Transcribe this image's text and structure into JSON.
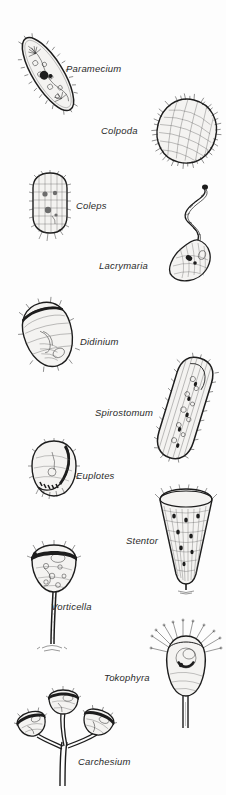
{
  "plate": {
    "title": "Ciliate protozoa illustration plate",
    "background_color": "#fdfdfd",
    "ink_color": "#1d1d1d",
    "label_style": "italic",
    "organisms": [
      {
        "id": "paramecium",
        "label": "Paramecium",
        "label_x": 66,
        "label_y": 64,
        "fig_x": 16,
        "fig_y": 26,
        "shape": "elongate-slipper",
        "cilia": "uniform-fringe"
      },
      {
        "id": "colpoda",
        "label": "Colpoda",
        "label_x": 101,
        "label_y": 126,
        "fig_x": 150,
        "fig_y": 95,
        "shape": "kidney-oval",
        "cilia": "spiky-fringe"
      },
      {
        "id": "coleps",
        "label": "Coleps",
        "label_x": 76,
        "label_y": 201,
        "fig_x": 26,
        "fig_y": 170,
        "shape": "barrel-plated",
        "cilia": "barbed-spines"
      },
      {
        "id": "lacrymaria",
        "label": "Lacrymaria",
        "label_x": 99,
        "label_y": 261,
        "fig_x": 148,
        "fig_y": 184,
        "shape": "long-necked-flask",
        "cilia": "fine-neck"
      },
      {
        "id": "didinium",
        "label": "Didinium",
        "label_x": 80,
        "label_y": 337,
        "fig_x": 16,
        "fig_y": 297,
        "shape": "tilted-barrel",
        "cilia": "girdle-bands"
      },
      {
        "id": "spirostomum",
        "label": "Spirostomum",
        "label_x": 95,
        "label_y": 408,
        "fig_x": 148,
        "fig_y": 352,
        "shape": "long-ribbon",
        "cilia": "lateral-rows"
      },
      {
        "id": "euplotes",
        "label": "Euplotes",
        "label_x": 76,
        "label_y": 471,
        "fig_x": 26,
        "fig_y": 438,
        "shape": "oval-flattened",
        "cilia": "cirri-tufts"
      },
      {
        "id": "stentor",
        "label": "Stentor",
        "label_x": 126,
        "label_y": 536,
        "fig_x": 150,
        "fig_y": 486,
        "shape": "trumpet",
        "cilia": "oral-crown"
      },
      {
        "id": "vorticella",
        "label": "Vorticella",
        "label_x": 51,
        "label_y": 602,
        "fig_x": 24,
        "fig_y": 540,
        "shape": "bell-on-stalk",
        "cilia": "oral-ring"
      },
      {
        "id": "tokophyra",
        "label": "Tokophyra",
        "label_x": 104,
        "label_y": 673,
        "fig_x": 150,
        "fig_y": 618,
        "shape": "suctorian-stalked",
        "cilia": "radiating-tentacles"
      },
      {
        "id": "carchesium",
        "label": "Carchesium",
        "label_x": 78,
        "label_y": 757,
        "fig_x": 16,
        "fig_y": 690,
        "shape": "branched-colony",
        "cilia": "multiple-bells"
      }
    ]
  }
}
